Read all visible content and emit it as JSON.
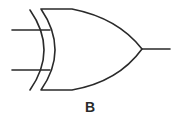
{
  "diagram": {
    "type": "logic-gate",
    "gate": "XOR",
    "inputs": 2,
    "outputs": 1,
    "label": "B",
    "stroke_color": "#2a2a2a"
  }
}
